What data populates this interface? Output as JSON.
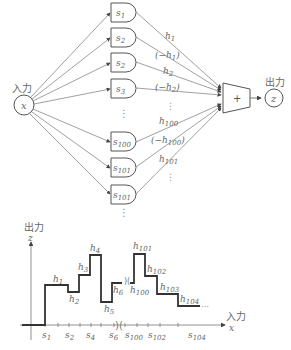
{
  "network": {
    "input": {
      "label": "入力",
      "var": "x"
    },
    "output": {
      "label": "出力",
      "var": "z"
    },
    "sum_symbol": "+",
    "units": [
      {
        "base": "s",
        "sub": "1",
        "weight_base": "h",
        "weight_sub": "1",
        "weight_text": "h1"
      },
      {
        "base": "s",
        "sub": "2",
        "weight_text": "(−h1)"
      },
      {
        "base": "s",
        "sub": "2",
        "weight_text": "h2"
      },
      {
        "base": "s",
        "sub": "3",
        "weight_text": "(−h2)"
      },
      {
        "base": "s",
        "sub": "100",
        "weight_text": "h100"
      },
      {
        "base": "s",
        "sub": "101",
        "weight_text": "(−h100)"
      },
      {
        "base": "s",
        "sub": "101",
        "weight_text": "h101"
      }
    ],
    "weights": [
      {
        "pre": "",
        "base": "h",
        "sub": "1",
        "post": ""
      },
      {
        "pre": "(−",
        "base": "h",
        "sub": "1",
        "post": ")"
      },
      {
        "pre": "",
        "base": "h",
        "sub": "2",
        "post": ""
      },
      {
        "pre": "(−",
        "base": "h",
        "sub": "2",
        "post": ")"
      },
      {
        "pre": "",
        "base": "h",
        "sub": "100",
        "post": ""
      },
      {
        "pre": "(−",
        "base": "h",
        "sub": "100",
        "post": ")"
      },
      {
        "pre": "",
        "base": "h",
        "sub": "101",
        "post": ""
      }
    ],
    "ellipsis": "⋮"
  },
  "plot": {
    "y_axis": {
      "label": "出力",
      "var": "z"
    },
    "x_axis": {
      "label": "入力",
      "var": "x"
    },
    "x_ticks": [
      {
        "base": "s",
        "sub": "1"
      },
      {
        "base": "s",
        "sub": "2"
      },
      {
        "base": "s",
        "sub": "4"
      },
      {
        "base": "s",
        "sub": "6"
      },
      {
        "base": "s",
        "sub": "100"
      },
      {
        "base": "s",
        "sub": "102"
      },
      {
        "base": "s",
        "sub": "104"
      }
    ],
    "step_labels": [
      {
        "base": "h",
        "sub": "1"
      },
      {
        "base": "h",
        "sub": "2"
      },
      {
        "base": "h",
        "sub": "3"
      },
      {
        "base": "h",
        "sub": "4"
      },
      {
        "base": "h",
        "sub": "5"
      },
      {
        "base": "h",
        "sub": "6"
      },
      {
        "base": "h",
        "sub": "100"
      },
      {
        "base": "h",
        "sub": "101"
      },
      {
        "base": "h",
        "sub": "102"
      },
      {
        "base": "h",
        "sub": "103"
      },
      {
        "base": "h",
        "sub": "104"
      }
    ],
    "trailing_ellipsis": "…",
    "break_mark": ")("
  }
}
